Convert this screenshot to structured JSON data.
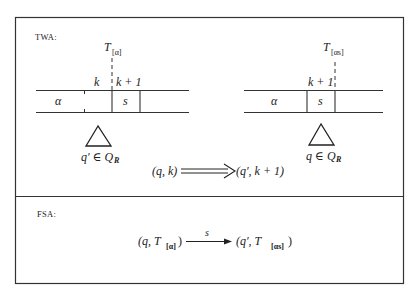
{
  "figure": {
    "sections": [
      {
        "id": "twa",
        "label": "TWA:",
        "left_config": {
          "head_marker": "T",
          "head_marker_sub": "[α]",
          "cells": [
            "α",
            "s"
          ],
          "position_labels": [
            "k",
            "k + 1"
          ],
          "state": "q′ ∈ Q",
          "state_set_sub": "R"
        },
        "right_config": {
          "head_marker": "T",
          "head_marker_sub": "[αs]",
          "cells": [
            "α",
            "s"
          ],
          "position_labels": [
            "k + 1"
          ],
          "state": "q ∈ Q",
          "state_set_sub": "R"
        },
        "transition": {
          "from": "(q, k)",
          "arrow": "double",
          "to": "(q′, k + 1)"
        }
      },
      {
        "id": "fsa",
        "label": "FSA:",
        "transition": {
          "from_prefix": "(q, T",
          "from_sub": "[α]",
          "from_suffix": ")",
          "arrow_label": "s",
          "to_prefix": "(q′, T",
          "to_sub": "[αs]",
          "to_suffix": ")"
        }
      }
    ]
  }
}
